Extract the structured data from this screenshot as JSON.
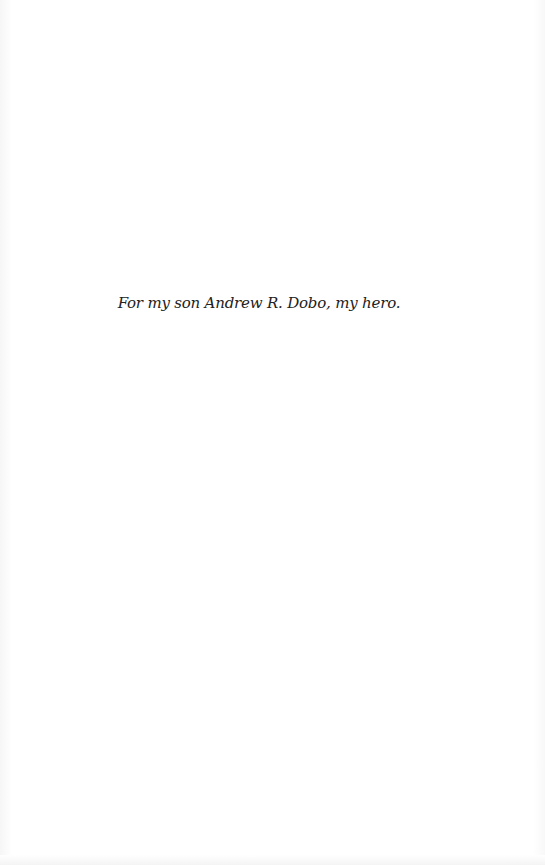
{
  "page": {
    "dedication": "For my son Andrew R. Dobo, my hero."
  }
}
